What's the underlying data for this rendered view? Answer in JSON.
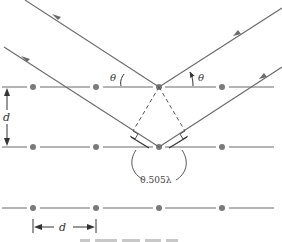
{
  "diagram": {
    "type": "bragg-diffraction",
    "labels": {
      "theta_incident": "θ",
      "theta_reflected": "θ",
      "spacing_vertical": "d",
      "spacing_horizontal": "d",
      "path_difference": "0.505λ"
    },
    "colors": {
      "line": "#6b6b6b",
      "atom": "#7a7a7a",
      "text": "#333333",
      "background": "#ffffff"
    },
    "lattice": {
      "rows": 3,
      "atoms_per_row": 4
    }
  }
}
